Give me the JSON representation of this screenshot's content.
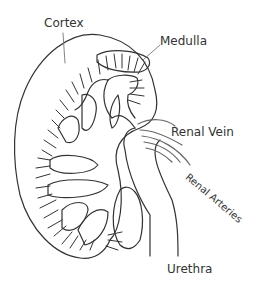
{
  "diagram": {
    "line_color": "#333333",
    "background": "#ffffff",
    "labels": {
      "cortex": "Cortex",
      "medulla": "Medulla",
      "renal_vein": "Renal Vein",
      "renal_arteries": "Renal Arteries",
      "urethra": "Urethra"
    }
  }
}
